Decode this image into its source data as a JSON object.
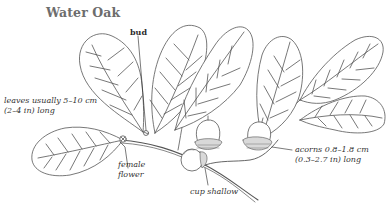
{
  "figure": {
    "title": "Water Oak",
    "line_color": "#555555",
    "labels": {
      "bud": "bud",
      "leaves": {
        "line1": "leaves usually 5–10 cm",
        "line2": "(2–4 in) long"
      },
      "female_flower": {
        "line1": "female",
        "line2": "flower"
      },
      "cup": "cup shallow",
      "acorns": {
        "line1": "acorns 0.8–1.8 cm",
        "line2": "(0.3–2.7 in) long"
      }
    }
  }
}
